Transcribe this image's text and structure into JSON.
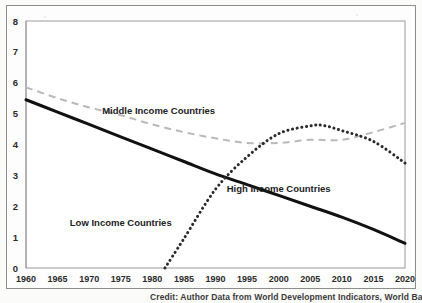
{
  "figure": {
    "credit": "Credit: Author Data from World Development Indicators, World Bank"
  },
  "chart_data": {
    "type": "line",
    "title": "",
    "xlabel": "",
    "ylabel": "",
    "xlim": [
      1960,
      2020
    ],
    "ylim": [
      0,
      8
    ],
    "grid": false,
    "legend_position": "inline-annotations",
    "x_ticks": [
      1960,
      1965,
      1970,
      1975,
      1980,
      1985,
      1990,
      1995,
      2000,
      2005,
      2010,
      2015,
      2020
    ],
    "y_ticks": [
      0,
      1,
      2,
      3,
      4,
      5,
      6,
      7,
      8
    ],
    "series": [
      {
        "name": "High Income Countries",
        "style": "solid",
        "color": "#111111",
        "label_x": 2000,
        "label_y": 2.45,
        "x": [
          1960,
          1965,
          1970,
          1975,
          1980,
          1985,
          1990,
          1995,
          2000,
          2005,
          2010,
          2015,
          2020
        ],
        "values": [
          5.45,
          5.05,
          4.65,
          4.25,
          3.85,
          3.45,
          3.05,
          2.7,
          2.35,
          2.0,
          1.65,
          1.25,
          0.8
        ]
      },
      {
        "name": "Middle Income Countries",
        "style": "dashed",
        "color": "#b9b9b9",
        "label_x": 1981,
        "label_y": 5.0,
        "x": [
          1960,
          1965,
          1970,
          1975,
          1980,
          1985,
          1990,
          1995,
          2000,
          2005,
          2010,
          2015,
          2020
        ],
        "values": [
          5.85,
          5.5,
          5.2,
          4.95,
          4.65,
          4.4,
          4.2,
          4.05,
          4.05,
          4.15,
          4.15,
          4.4,
          4.7
        ]
      },
      {
        "name": "Low Income Countries",
        "style": "dotted",
        "color": "#2b2b2b",
        "label_x": 1975,
        "label_y": 1.35,
        "x": [
          1982,
          1985,
          1990,
          1995,
          2000,
          2005,
          2007,
          2010,
          2015,
          2020
        ],
        "values": [
          0.0,
          0.95,
          2.55,
          3.6,
          4.35,
          4.6,
          4.62,
          4.45,
          4.1,
          3.4
        ]
      }
    ]
  }
}
